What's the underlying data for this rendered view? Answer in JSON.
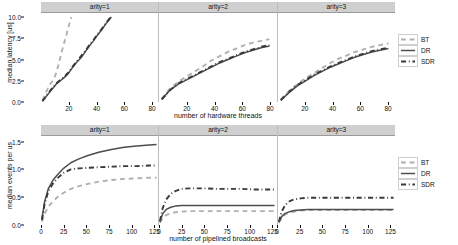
{
  "figure": {
    "panel_titles": [
      "arity=1",
      "arity=2",
      "arity=3"
    ],
    "legend_entries": [
      {
        "label": "BT",
        "style": "dashed",
        "color": "#b0b0b0"
      },
      {
        "label": "DR",
        "style": "solid",
        "color": "#4d4d4d"
      },
      {
        "label": "SDR",
        "style": "dashdot",
        "color": "#3a3a3a"
      }
    ]
  },
  "chart_data": [
    {
      "type": "line",
      "title": "",
      "xlabel": "number of hardware threads",
      "ylabel": "median latency [us]",
      "xlim": [
        0,
        85
      ],
      "ylim": [
        0,
        10.6
      ],
      "xticks": [
        20,
        40,
        60,
        80
      ],
      "yticks": [
        0.0,
        2.5,
        5.0,
        7.5,
        10.0
      ],
      "ytick_labels": [
        "0.0",
        "2.5",
        "5.0",
        "7.5",
        "10.0"
      ],
      "grid": false,
      "legend_position": "right",
      "facets": [
        {
          "name": "arity=1",
          "series": [
            {
              "name": "BT",
              "x": [
                1,
                3,
                5,
                7,
                9,
                11,
                13,
                15,
                17,
                19,
                21,
                22
              ],
              "y": [
                0.2,
                0.9,
                1.6,
                2.2,
                2.6,
                3.4,
                4.6,
                5.9,
                7.1,
                8.3,
                9.5,
                10.0
              ]
            },
            {
              "name": "DR",
              "x": [
                1,
                3,
                5,
                8,
                11,
                14,
                17,
                20,
                23,
                26,
                29,
                32,
                35,
                38,
                41,
                44,
                47,
                50,
                51
              ],
              "y": [
                0.1,
                0.5,
                0.9,
                1.5,
                2.1,
                2.5,
                2.9,
                3.4,
                4.1,
                4.7,
                5.2,
                5.9,
                6.6,
                7.2,
                7.9,
                8.5,
                9.2,
                9.8,
                10.0
              ]
            },
            {
              "name": "SDR",
              "x": [
                1,
                3,
                5,
                8,
                11,
                14,
                17,
                20,
                23,
                26,
                29,
                32,
                35,
                38,
                41,
                44,
                47,
                50,
                51
              ],
              "y": [
                0.1,
                0.5,
                1.0,
                1.6,
                2.2,
                2.6,
                3.0,
                3.5,
                4.2,
                4.8,
                5.4,
                6.0,
                6.7,
                7.3,
                8.0,
                8.6,
                9.3,
                9.9,
                10.1
              ]
            }
          ]
        },
        {
          "name": "arity=2",
          "series": [
            {
              "name": "BT",
              "x": [
                2,
                8,
                14,
                20,
                26,
                32,
                38,
                44,
                50,
                56,
                62,
                68,
                74,
                80
              ],
              "y": [
                0.4,
                1.6,
                2.4,
                3.0,
                3.6,
                4.2,
                4.9,
                5.4,
                5.9,
                6.3,
                6.7,
                7.0,
                7.2,
                7.4
              ]
            },
            {
              "name": "DR",
              "x": [
                2,
                8,
                14,
                20,
                26,
                32,
                38,
                44,
                50,
                56,
                62,
                68,
                74,
                80
              ],
              "y": [
                0.3,
                1.4,
                2.1,
                2.6,
                3.1,
                3.6,
                4.1,
                4.6,
                5.0,
                5.4,
                5.8,
                6.1,
                6.4,
                6.6
              ]
            },
            {
              "name": "SDR",
              "x": [
                2,
                8,
                14,
                20,
                26,
                32,
                38,
                44,
                50,
                56,
                62,
                68,
                74,
                80
              ],
              "y": [
                0.3,
                1.4,
                2.2,
                2.7,
                3.2,
                3.7,
                4.2,
                4.7,
                5.1,
                5.5,
                5.9,
                6.2,
                6.5,
                6.7
              ]
            }
          ]
        },
        {
          "name": "arity=3",
          "series": [
            {
              "name": "BT",
              "x": [
                2,
                8,
                14,
                20,
                26,
                32,
                38,
                44,
                50,
                56,
                62,
                68,
                74,
                80
              ],
              "y": [
                0.3,
                1.3,
                2.1,
                2.8,
                3.4,
                4.0,
                4.6,
                5.1,
                5.5,
                5.9,
                6.2,
                6.5,
                6.7,
                6.9
              ]
            },
            {
              "name": "DR",
              "x": [
                2,
                8,
                14,
                20,
                26,
                32,
                38,
                44,
                50,
                56,
                62,
                68,
                74,
                80
              ],
              "y": [
                0.2,
                1.1,
                1.9,
                2.5,
                3.1,
                3.6,
                4.1,
                4.5,
                4.9,
                5.3,
                5.6,
                5.9,
                6.1,
                6.3
              ]
            },
            {
              "name": "SDR",
              "x": [
                2,
                8,
                14,
                20,
                26,
                32,
                38,
                44,
                50,
                56,
                62,
                68,
                74,
                80
              ],
              "y": [
                0.2,
                1.2,
                2.0,
                2.6,
                3.2,
                3.7,
                4.2,
                4.6,
                5.0,
                5.4,
                5.7,
                6.0,
                6.2,
                6.4
              ]
            }
          ]
        }
      ]
    },
    {
      "type": "line",
      "title": "",
      "xlabel": "number of pipelined broadcasts",
      "ylabel": "median events per us",
      "xlim": [
        0,
        130
      ],
      "ylim": [
        0,
        1.62
      ],
      "xticks": [
        0,
        25,
        50,
        75,
        100,
        125
      ],
      "yticks": [
        0.0,
        0.5,
        1.0,
        1.5
      ],
      "ytick_labels": [
        "0.0",
        "0.5",
        "1.0",
        "1.5"
      ],
      "grid": false,
      "legend_position": "right",
      "facets": [
        {
          "name": "arity=1",
          "series": [
            {
              "name": "BT",
              "x": [
                1,
                4,
                8,
                13,
                18,
                25,
                33,
                42,
                52,
                64,
                78,
                92,
                106,
                120,
                128
              ],
              "y": [
                0.06,
                0.2,
                0.33,
                0.42,
                0.5,
                0.58,
                0.65,
                0.7,
                0.74,
                0.78,
                0.81,
                0.83,
                0.84,
                0.85,
                0.85
              ]
            },
            {
              "name": "DR",
              "x": [
                1,
                4,
                8,
                13,
                18,
                25,
                33,
                42,
                52,
                64,
                78,
                92,
                106,
                120,
                128
              ],
              "y": [
                0.1,
                0.42,
                0.65,
                0.8,
                0.9,
                1.02,
                1.12,
                1.19,
                1.25,
                1.31,
                1.36,
                1.4,
                1.42,
                1.44,
                1.45
              ]
            },
            {
              "name": "SDR",
              "x": [
                1,
                4,
                8,
                13,
                18,
                25,
                33,
                42,
                52,
                64,
                78,
                92,
                106,
                120,
                128
              ],
              "y": [
                0.09,
                0.38,
                0.6,
                0.74,
                0.84,
                0.94,
                1.0,
                1.02,
                1.03,
                1.04,
                1.05,
                1.06,
                1.06,
                1.07,
                1.07
              ]
            }
          ]
        },
        {
          "name": "arity=2",
          "series": [
            {
              "name": "BT",
              "x": [
                1,
                4,
                8,
                13,
                18,
                25,
                33,
                42,
                52,
                64,
                78,
                92,
                106,
                120,
                128
              ],
              "y": [
                0.04,
                0.12,
                0.18,
                0.21,
                0.23,
                0.24,
                0.25,
                0.25,
                0.25,
                0.25,
                0.25,
                0.25,
                0.25,
                0.25,
                0.25
              ]
            },
            {
              "name": "DR",
              "x": [
                1,
                4,
                8,
                13,
                18,
                25,
                33,
                42,
                52,
                64,
                78,
                92,
                106,
                120,
                128
              ],
              "y": [
                0.06,
                0.2,
                0.28,
                0.32,
                0.34,
                0.35,
                0.35,
                0.35,
                0.35,
                0.35,
                0.35,
                0.35,
                0.35,
                0.35,
                0.35
              ]
            },
            {
              "name": "SDR",
              "x": [
                1,
                4,
                8,
                13,
                18,
                25,
                33,
                42,
                52,
                64,
                78,
                92,
                106,
                120,
                128
              ],
              "y": [
                0.07,
                0.3,
                0.46,
                0.56,
                0.61,
                0.65,
                0.66,
                0.66,
                0.66,
                0.65,
                0.65,
                0.65,
                0.64,
                0.64,
                0.64
              ]
            }
          ]
        },
        {
          "name": "arity=3",
          "series": [
            {
              "name": "BT",
              "x": [
                1,
                4,
                8,
                13,
                18,
                25,
                33,
                42,
                52,
                64,
                78,
                92,
                106,
                120,
                128
              ],
              "y": [
                0.04,
                0.13,
                0.19,
                0.22,
                0.24,
                0.26,
                0.27,
                0.27,
                0.27,
                0.27,
                0.27,
                0.27,
                0.27,
                0.27,
                0.27
              ]
            },
            {
              "name": "DR",
              "x": [
                1,
                4,
                8,
                13,
                18,
                25,
                33,
                42,
                52,
                64,
                78,
                92,
                106,
                120,
                128
              ],
              "y": [
                0.05,
                0.15,
                0.21,
                0.24,
                0.26,
                0.27,
                0.28,
                0.28,
                0.28,
                0.28,
                0.28,
                0.28,
                0.28,
                0.28,
                0.28
              ]
            },
            {
              "name": "SDR",
              "x": [
                1,
                4,
                8,
                13,
                18,
                25,
                33,
                42,
                52,
                64,
                78,
                92,
                106,
                120,
                128
              ],
              "y": [
                0.06,
                0.24,
                0.36,
                0.43,
                0.46,
                0.48,
                0.49,
                0.49,
                0.49,
                0.49,
                0.49,
                0.49,
                0.49,
                0.49,
                0.49
              ]
            }
          ]
        }
      ]
    }
  ]
}
